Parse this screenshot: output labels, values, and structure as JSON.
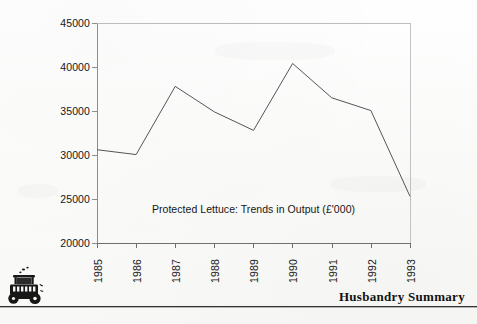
{
  "document": {
    "footer_title": "Husbandry Summary",
    "icon_name": "tractor-icon"
  },
  "chart_data": {
    "type": "line",
    "title": "Protected Lettuce: Trends in Output (£'000)",
    "xlabel": "",
    "ylabel": "",
    "categories": [
      "1985",
      "1986",
      "1987",
      "1988",
      "1989",
      "1990",
      "1991",
      "1992",
      "1993"
    ],
    "values": [
      30600,
      30050,
      37800,
      34900,
      32800,
      40400,
      36500,
      35050,
      25300
    ],
    "ylim": [
      20000,
      45000
    ],
    "yticks": [
      45000,
      40000,
      35000,
      30000,
      25000,
      20000
    ],
    "ytick_labels": [
      "45000",
      "40000",
      "35000",
      "30000",
      "25000",
      "20000"
    ],
    "grid": false,
    "legend": false,
    "legend_position": "none",
    "line_color": "#555555",
    "axis_color": "#8a8a8a",
    "series": [
      {
        "name": "Protected Lettuce Output",
        "values": [
          30600,
          30050,
          37800,
          34900,
          32800,
          40400,
          36500,
          35050,
          25300
        ]
      }
    ]
  }
}
